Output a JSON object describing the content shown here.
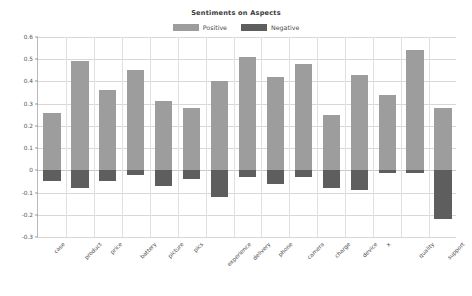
{
  "chart_data": {
    "type": "bar",
    "title": "Sentiments on Aspects",
    "xlabel": "",
    "ylabel": "",
    "ylim": [
      -0.3,
      0.6
    ],
    "yticks": [
      0.6,
      0.5,
      0.4,
      0.3,
      0.2,
      0.1,
      0,
      -0.1,
      -0.2,
      -0.3
    ],
    "ytick_labels": [
      "0.6",
      "0.5",
      "0.4",
      "0.3",
      "0.2",
      "0.1",
      "0",
      "-0.1",
      "-0.2",
      "-0.3"
    ],
    "grid": true,
    "legend_position": "top-center",
    "stacked": true,
    "categories": [
      "case",
      "product",
      "price",
      "battery",
      "picture",
      "pics",
      "experience",
      "delivery",
      "phone",
      "camera",
      "charge",
      "device",
      "x",
      "quality",
      "support"
    ],
    "series": [
      {
        "name": "Positive",
        "color": "#9d9d9d",
        "values": [
          0.26,
          0.49,
          0.36,
          0.45,
          0.31,
          0.28,
          0.4,
          0.51,
          0.42,
          0.48,
          0.25,
          0.43,
          0.34,
          0.54,
          0.28
        ]
      },
      {
        "name": "Negative",
        "color": "#5e5e5e",
        "values": [
          -0.05,
          -0.08,
          -0.05,
          -0.02,
          -0.07,
          -0.04,
          -0.12,
          -0.03,
          -0.06,
          -0.03,
          -0.08,
          -0.09,
          -0.01,
          -0.01,
          -0.22
        ]
      }
    ]
  },
  "legend": {
    "items": [
      {
        "label": "Positive",
        "color": "#9d9d9d"
      },
      {
        "label": "Negative",
        "color": "#5e5e5e"
      }
    ]
  }
}
